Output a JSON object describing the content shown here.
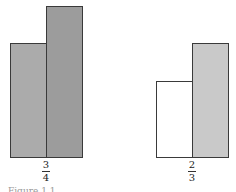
{
  "figure": {
    "caption": "Figure 1.1",
    "groups": [
      {
        "label": {
          "numerator": "3",
          "denominator": "4"
        },
        "bars": [
          {
            "name": "left-bar",
            "relative_height": 0.75,
            "fill": "#ababab"
          },
          {
            "name": "right-bar",
            "relative_height": 1.0,
            "fill": "#9c9c9c"
          }
        ]
      },
      {
        "label": {
          "numerator": "2",
          "denominator": "3"
        },
        "bars": [
          {
            "name": "left-bar",
            "relative_height": 0.5,
            "fill": "#ffffff"
          },
          {
            "name": "right-bar",
            "relative_height": 0.75,
            "fill": "#c9c9c9"
          }
        ]
      }
    ]
  }
}
